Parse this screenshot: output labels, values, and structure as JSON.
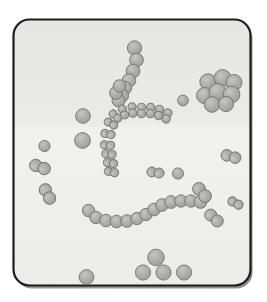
{
  "figure": {
    "background_color": "#ffffff",
    "frame": {
      "x": 13.5,
      "y": 19.5,
      "width": 237,
      "height": 266,
      "rx": 16,
      "fill_top": "#e8e8e6",
      "fill_bottom": "#efefed",
      "stroke": "#1d1d1d",
      "stroke_width": 2.2,
      "shadow_color": "#8e8e8e",
      "shadow_offset_x": 2,
      "shadow_offset_y": 3
    },
    "cell_style": {
      "fill": "#a9a9a7",
      "fill_highlight": "#c2c2bf",
      "stroke": "#6f6f6d",
      "stroke_width": 0.9,
      "opacity": 0.97
    }
  },
  "chart_data": {
    "type": "scatter",
    "xlabel": "",
    "ylabel": "",
    "xlim": [
      13.5,
      250.5
    ],
    "ylim": [
      19.5,
      285.5
    ],
    "grid": false,
    "legend": "none",
    "units": "pixels",
    "groups": [
      {
        "name": "staphylococci-cluster",
        "label": "Staphylococci (grape-like cluster)",
        "count": 8,
        "cells": [
          {
            "cx": 208.0,
            "cy": 82.0,
            "r": 8.2
          },
          {
            "cx": 222.5,
            "cy": 78.0,
            "r": 8.4
          },
          {
            "cx": 234.0,
            "cy": 82.5,
            "r": 8.0
          },
          {
            "cx": 204.5,
            "cy": 95.5,
            "r": 8.0
          },
          {
            "cx": 217.5,
            "cy": 92.0,
            "r": 8.6
          },
          {
            "cx": 231.5,
            "cy": 94.5,
            "r": 8.4
          },
          {
            "cx": 212.0,
            "cy": 104.5,
            "r": 7.8
          },
          {
            "cx": 226.0,
            "cy": 104.0,
            "r": 7.6
          }
        ]
      },
      {
        "name": "streptococci-diagonal-chain",
        "label": "Streptococci (diagonal chain, upper)",
        "count": 9,
        "cells": [
          {
            "cx": 134.5,
            "cy": 48.0,
            "r": 7.2
          },
          {
            "cx": 136.5,
            "cy": 60.0,
            "r": 6.9
          },
          {
            "cx": 133.0,
            "cy": 71.0,
            "r": 6.9
          },
          {
            "cx": 129.0,
            "cy": 80.5,
            "r": 6.8
          },
          {
            "cx": 125.0,
            "cy": 88.0,
            "r": 6.6
          },
          {
            "cx": 122.0,
            "cy": 95.5,
            "r": 6.6
          },
          {
            "cx": 118.5,
            "cy": 100.5,
            "r": 6.5
          },
          {
            "cx": 116.0,
            "cy": 93.0,
            "r": 6.4
          },
          {
            "cx": 119.5,
            "cy": 86.0,
            "r": 6.3
          }
        ]
      },
      {
        "name": "diplococci-c-arc",
        "label": "Diplococci (C-shaped arc, center)",
        "count": 13,
        "pairs": [
          {
            "cx": 111.0,
            "cy": 123.5,
            "angle": -62
          },
          {
            "cx": 115.5,
            "cy": 116.0,
            "angle": -48
          },
          {
            "cx": 123.5,
            "cy": 112.0,
            "angle": -22
          },
          {
            "cx": 132.5,
            "cy": 110.0,
            "angle": -8
          },
          {
            "cx": 141.5,
            "cy": 110.5,
            "angle": 0
          },
          {
            "cx": 150.5,
            "cy": 110.5,
            "angle": 4
          },
          {
            "cx": 159.0,
            "cy": 112.5,
            "angle": 10
          },
          {
            "cx": 167.0,
            "cy": 116.0,
            "angle": 16
          },
          {
            "cx": 108.0,
            "cy": 134.0,
            "angle": -80
          },
          {
            "cx": 107.5,
            "cy": 145.0,
            "angle": -86
          },
          {
            "cx": 109.0,
            "cy": 154.0,
            "angle": -84
          },
          {
            "cx": 110.5,
            "cy": 163.0,
            "angle": -80
          },
          {
            "cx": 111.5,
            "cy": 172.0,
            "angle": -78
          }
        ],
        "pair_radius": 4.1,
        "pair_gap": 6.2
      },
      {
        "name": "streptococci-wavy-chain",
        "label": "Streptococci (wavy chain, lower)",
        "count": 13,
        "cells": [
          {
            "cx": 88.5,
            "cy": 210.5,
            "r": 6.2
          },
          {
            "cx": 96.0,
            "cy": 217.5,
            "r": 6.2
          },
          {
            "cx": 106.0,
            "cy": 220.5,
            "r": 6.3
          },
          {
            "cx": 116.5,
            "cy": 221.5,
            "r": 6.3
          },
          {
            "cx": 127.0,
            "cy": 221.0,
            "r": 6.3
          },
          {
            "cx": 137.0,
            "cy": 218.5,
            "r": 6.2
          },
          {
            "cx": 146.0,
            "cy": 214.5,
            "r": 6.2
          },
          {
            "cx": 154.0,
            "cy": 209.5,
            "r": 6.3
          },
          {
            "cx": 162.0,
            "cy": 205.0,
            "r": 6.3
          },
          {
            "cx": 171.0,
            "cy": 202.0,
            "r": 6.4
          },
          {
            "cx": 181.0,
            "cy": 201.0,
            "r": 6.2
          },
          {
            "cx": 191.0,
            "cy": 201.0,
            "r": 6.2
          },
          {
            "cx": 200.5,
            "cy": 202.0,
            "r": 6.4
          }
        ]
      },
      {
        "name": "diplococci-scattered",
        "label": "Diplococci (scattered pairs)",
        "count": 6,
        "pairs": [
          {
            "cx": 40.0,
            "cy": 167.0,
            "angle": -70,
            "r": 6.2,
            "gap": 9.0
          },
          {
            "cx": 47.5,
            "cy": 194.0,
            "angle": -28,
            "r": 6.2,
            "gap": 9.2
          },
          {
            "cx": 155.5,
            "cy": 172.5,
            "angle": -82,
            "r": 5.0,
            "gap": 7.4
          },
          {
            "cx": 231.0,
            "cy": 156.5,
            "angle": -74,
            "r": 5.8,
            "gap": 8.6
          },
          {
            "cx": 202.0,
            "cy": 192.5,
            "angle": -40,
            "r": 6.4,
            "gap": 9.4
          },
          {
            "cx": 214.0,
            "cy": 218.0,
            "angle": -48,
            "r": 6.0,
            "gap": 8.8
          },
          {
            "cx": 235.5,
            "cy": 203.0,
            "angle": -62,
            "r": 4.6,
            "gap": 6.8
          }
        ]
      },
      {
        "name": "single-cocci",
        "label": "Single cocci (isolated)",
        "count": 10,
        "cells": [
          {
            "cx": 83.0,
            "cy": 116.0,
            "r": 7.3
          },
          {
            "cx": 82.5,
            "cy": 140.5,
            "r": 7.9
          },
          {
            "cx": 44.5,
            "cy": 146.0,
            "r": 5.6
          },
          {
            "cx": 183.0,
            "cy": 100.5,
            "r": 5.4
          },
          {
            "cx": 86.5,
            "cy": 277.0,
            "r": 7.4
          },
          {
            "cx": 156.0,
            "cy": 257.5,
            "r": 8.3
          },
          {
            "cx": 143.0,
            "cy": 272.5,
            "r": 7.6
          },
          {
            "cx": 163.5,
            "cy": 272.5,
            "r": 7.6
          },
          {
            "cx": 184.0,
            "cy": 272.5,
            "r": 7.6
          },
          {
            "cx": 178.0,
            "cy": 173.5,
            "r": 5.6
          }
        ]
      }
    ],
    "summary": {
      "total_cells": 71,
      "arrangement_types": 4
    }
  }
}
